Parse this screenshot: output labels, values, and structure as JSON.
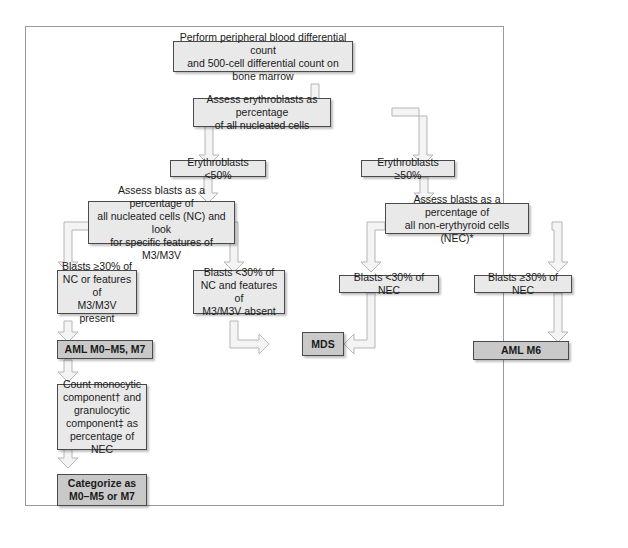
{
  "diagram": {
    "type": "flowchart",
    "colors": {
      "box_fill": "#e9e9e9",
      "terminal_fill": "#c9c9c9",
      "border": "#4a4a4a",
      "arrow_fill": "#f4f4f4",
      "arrow_stroke": "#b5b5b5",
      "frame": "#9a9a9a"
    },
    "nodes": {
      "start": "Perform peripheral blood differential count\nand 500-cell differential count on bone marrow",
      "assess_erythroblasts": "Assess erythroblasts as percentage\nof all nucleated cells",
      "erythro_lt50": "Erythroblasts <50%",
      "erythro_ge50": "Erythroblasts ≥50%",
      "assess_blasts_nc": "Assess blasts as a percentage of\nall nucleated cells (NC) and look\nfor specific features of M3/M3V",
      "assess_blasts_nec": "Assess blasts as a percentage of\nall non-erythyroid cells (NEC)*",
      "blasts_ge30_nc": "Blasts ≥30% of\nNC or features of\nM3/M3V present",
      "blasts_lt30_nc": "Blasts <30% of\nNC and features of\nM3/M3V absent",
      "blasts_lt30_nec": "Blasts <30% of NEC",
      "blasts_ge30_nec": "Blasts ≥30% of NEC",
      "aml_m0_m5_m7": "AML M0–M5, M7",
      "mds": "MDS",
      "aml_m6": "AML M6",
      "count_components": "Count monocytic\ncomponent† and\ngranulocytic\ncomponent‡ as\npercentage of NEC",
      "categorize": "Categorize as\nM0–M5 or M7"
    },
    "edges": [
      [
        "start",
        "assess_erythroblasts"
      ],
      [
        "assess_erythroblasts",
        "erythro_lt50"
      ],
      [
        "assess_erythroblasts",
        "erythro_ge50"
      ],
      [
        "erythro_lt50",
        "assess_blasts_nc"
      ],
      [
        "erythro_ge50",
        "assess_blasts_nec"
      ],
      [
        "assess_blasts_nc",
        "blasts_ge30_nc"
      ],
      [
        "assess_blasts_nc",
        "blasts_lt30_nc"
      ],
      [
        "assess_blasts_nec",
        "blasts_lt30_nec"
      ],
      [
        "assess_blasts_nec",
        "blasts_ge30_nec"
      ],
      [
        "blasts_ge30_nc",
        "aml_m0_m5_m7"
      ],
      [
        "blasts_lt30_nc",
        "mds"
      ],
      [
        "blasts_lt30_nec",
        "mds"
      ],
      [
        "blasts_ge30_nec",
        "aml_m6"
      ],
      [
        "aml_m0_m5_m7",
        "count_components"
      ],
      [
        "count_components",
        "categorize"
      ]
    ]
  }
}
